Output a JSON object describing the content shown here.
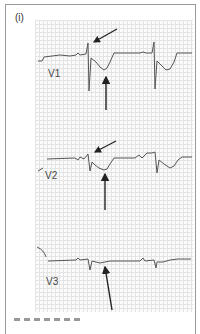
{
  "figure": {
    "panel_label": "(i)",
    "leads": [
      {
        "name": "V1",
        "label": "V1"
      },
      {
        "name": "V2",
        "label": "V2"
      },
      {
        "name": "V3",
        "label": "V3"
      }
    ],
    "annotations": {
      "v1_upper_arrow": "points to terminal R' notch",
      "v1_lower_arrow": "points to ST/T depression",
      "v2_upper_arrow": "points to terminal R' notch",
      "v2_lower_arrow": "points to ST/T depression",
      "v3_arrow": "points to ST segment"
    },
    "colors": {
      "trace": "#555555",
      "arrow": "#222222",
      "grid": "#e4e4e4",
      "frame": "#9a9a9a"
    }
  }
}
